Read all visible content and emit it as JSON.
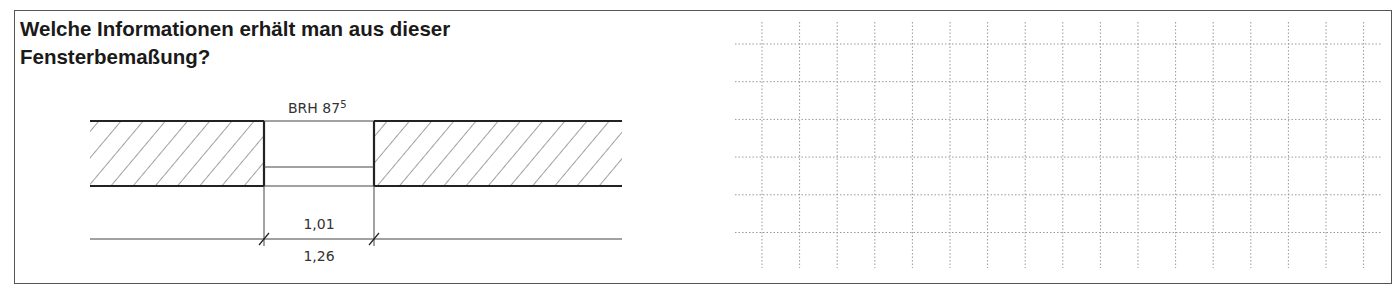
{
  "page": {
    "question_number_partial": "999",
    "title": "Welche Informationen erhält man aus dieser Fensterbemaßung?",
    "title_line1": "Welche Informationen erhält man aus dieser",
    "title_line2": "Fensterbemaßung?"
  },
  "drawing": {
    "type": "window-opening-floor-plan",
    "brh_label": "BRH 87",
    "brh_superscript": "5",
    "inner_dimension": "1,01",
    "outer_dimension": "1,26",
    "line_color": "#333333",
    "hatch_color": "#444444"
  },
  "answer_grid": {
    "columns": 17,
    "rows": 6,
    "line_style": "dotted",
    "line_color": "#999999"
  }
}
